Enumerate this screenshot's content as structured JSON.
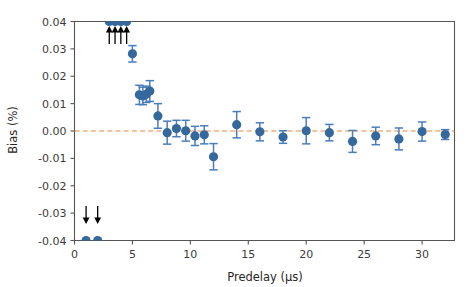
{
  "chart_data": {
    "type": "scatter",
    "title": "",
    "xlabel": "Predelay (μs)",
    "ylabel": "Bias (%)",
    "xlim": [
      0,
      32.8
    ],
    "ylim": [
      -0.04,
      0.04
    ],
    "xticks": [
      0,
      5,
      10,
      15,
      20,
      25,
      30
    ],
    "xticklabels": [
      "0",
      "5",
      "10",
      "15",
      "20",
      "25",
      "30"
    ],
    "yticks": [
      -0.04,
      -0.03,
      -0.02,
      -0.01,
      0.0,
      0.01,
      0.02,
      0.03,
      0.04
    ],
    "yticklabels": [
      "-0.04",
      "-0.03",
      "-0.02",
      "-0.01",
      "0.00",
      "0.01",
      "0.02",
      "0.03",
      "0.04"
    ],
    "grid": false,
    "legend": null,
    "reference_lines": [
      {
        "name": "zero-line",
        "orientation": "horizontal",
        "y": 0.0,
        "style": "dashed",
        "color": "#e8802f"
      }
    ],
    "series": [
      {
        "name": "bias-vs-predelay",
        "marker": "circle",
        "color": "#35699e",
        "errorbar_color": "#4a7ebb",
        "points": [
          {
            "x": 1,
            "y": -0.04,
            "yerr": 0.0,
            "clipped": "below"
          },
          {
            "x": 2,
            "y": -0.04,
            "yerr": 0.0,
            "clipped": "below"
          },
          {
            "x": 3,
            "y": 0.04,
            "yerr": 0.0,
            "clipped": "above"
          },
          {
            "x": 3.5,
            "y": 0.04,
            "yerr": 0.0,
            "clipped": "above"
          },
          {
            "x": 4,
            "y": 0.04,
            "yerr": 0.0,
            "clipped": "above"
          },
          {
            "x": 4.5,
            "y": 0.04,
            "yerr": 0.0,
            "clipped": "above"
          },
          {
            "x": 5,
            "y": 0.0282,
            "yerr": 0.003,
            "clipped": "none"
          },
          {
            "x": 5.6,
            "y": 0.0132,
            "yerr": 0.0035,
            "clipped": "none"
          },
          {
            "x": 5.9,
            "y": 0.0128,
            "yerr": 0.0032,
            "clipped": "none"
          },
          {
            "x": 6.2,
            "y": 0.0134,
            "yerr": 0.003,
            "clipped": "none"
          },
          {
            "x": 6.5,
            "y": 0.0146,
            "yerr": 0.0038,
            "clipped": "none"
          },
          {
            "x": 7.2,
            "y": 0.0055,
            "yerr": 0.0045,
            "clipped": "none"
          },
          {
            "x": 8.0,
            "y": -0.0006,
            "yerr": 0.0042,
            "clipped": "none"
          },
          {
            "x": 8.8,
            "y": 0.0009,
            "yerr": 0.003,
            "clipped": "none"
          },
          {
            "x": 9.6,
            "y": 0.0001,
            "yerr": 0.0038,
            "clipped": "none"
          },
          {
            "x": 10.4,
            "y": -0.0018,
            "yerr": 0.0035,
            "clipped": "none"
          },
          {
            "x": 11.2,
            "y": -0.0014,
            "yerr": 0.0033,
            "clipped": "none"
          },
          {
            "x": 12.0,
            "y": -0.0094,
            "yerr": 0.0048,
            "clipped": "none"
          },
          {
            "x": 14.0,
            "y": 0.0023,
            "yerr": 0.0048,
            "clipped": "none"
          },
          {
            "x": 16.0,
            "y": -0.0003,
            "yerr": 0.0033,
            "clipped": "none"
          },
          {
            "x": 18.0,
            "y": -0.0022,
            "yerr": 0.0023,
            "clipped": "none"
          },
          {
            "x": 20.0,
            "y": 0.0001,
            "yerr": 0.0048,
            "clipped": "none"
          },
          {
            "x": 22.0,
            "y": -0.0006,
            "yerr": 0.003,
            "clipped": "none"
          },
          {
            "x": 24.0,
            "y": -0.0038,
            "yerr": 0.004,
            "clipped": "none"
          },
          {
            "x": 26.0,
            "y": -0.0018,
            "yerr": 0.0032,
            "clipped": "none"
          },
          {
            "x": 28.0,
            "y": -0.0029,
            "yerr": 0.004,
            "clipped": "none"
          },
          {
            "x": 30.0,
            "y": -0.0002,
            "yerr": 0.0035,
            "clipped": "none"
          },
          {
            "x": 32.0,
            "y": -0.0013,
            "yerr": 0.0018,
            "clipped": "none"
          }
        ]
      }
    ],
    "annotations": [
      {
        "name": "up-arrow-1",
        "type": "arrow",
        "direction": "up",
        "x": 3.0
      },
      {
        "name": "up-arrow-2",
        "type": "arrow",
        "direction": "up",
        "x": 3.5
      },
      {
        "name": "up-arrow-3",
        "type": "arrow",
        "direction": "up",
        "x": 4.0
      },
      {
        "name": "up-arrow-4",
        "type": "arrow",
        "direction": "up",
        "x": 4.5
      },
      {
        "name": "down-arrow-1",
        "type": "arrow",
        "direction": "down",
        "x": 1.0
      },
      {
        "name": "down-arrow-2",
        "type": "arrow",
        "direction": "down",
        "x": 2.0
      }
    ]
  },
  "colors": {
    "marker": "#35699e",
    "errorbar": "#4a7ebb",
    "zero_line": "#e8802f",
    "axis": "#555555",
    "text": "#262626",
    "background": "#ffffff"
  }
}
